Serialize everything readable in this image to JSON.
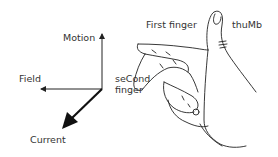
{
  "diagram": {
    "axes": {
      "motion_label": "Motion",
      "field_label": "Field",
      "current_label": "Current"
    },
    "hand": {
      "first_finger_label": "First finger",
      "thumb_label": "thuMb",
      "second_finger_label_line1": "seCond",
      "second_finger_label_line2": "finger"
    },
    "colors": {
      "ink": "#222222",
      "text": "#333333",
      "background": "#ffffff"
    }
  }
}
